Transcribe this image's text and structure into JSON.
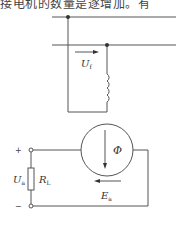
{
  "page": {
    "header_text_fragment": "接电机的数量是逐增加。有"
  },
  "diagram": {
    "excitation_voltage_label": "U",
    "excitation_voltage_sub": "f",
    "flux_label": "Φ",
    "emf_label": "E",
    "emf_sub": "a",
    "terminal_voltage_label": "U",
    "terminal_voltage_sub": "a",
    "load_resistor_label": "R",
    "load_resistor_sub": "L",
    "plus_sign": "+",
    "minus_sign": "−",
    "line_color": "#555555"
  }
}
